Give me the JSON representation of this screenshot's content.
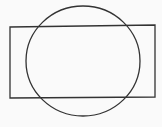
{
  "diagram": {
    "background": "#fafafa",
    "stroke_color": "#333333",
    "stroke_width": 1.3,
    "shapes": [
      {
        "type": "rectangle",
        "points": "10,27 155,25 155,97 10,98"
      },
      {
        "type": "ellipse",
        "cx": 83,
        "cy": 61,
        "rx": 57,
        "ry": 55
      }
    ]
  }
}
